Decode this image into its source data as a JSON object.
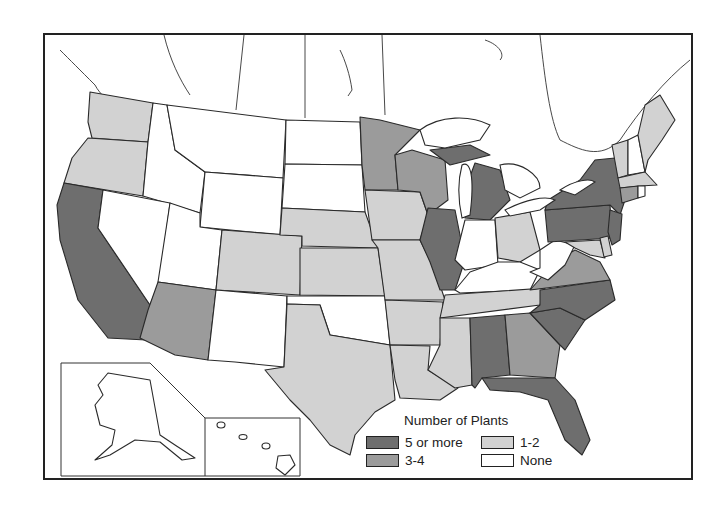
{
  "legend": {
    "title": "Number of Plants",
    "items": [
      {
        "key": "c5",
        "label": "5 or more",
        "color": "#6e6e6e"
      },
      {
        "key": "c1",
        "label": "1-2",
        "color": "#d2d2d2"
      },
      {
        "key": "c3",
        "label": "3-4",
        "color": "#9b9b9b"
      },
      {
        "key": "c0",
        "label": "None",
        "color": "#ffffff"
      }
    ]
  },
  "categories": {
    "5 or more": [
      "California",
      "Illinois",
      "Michigan",
      "New York",
      "Pennsylvania",
      "New Jersey",
      "North Carolina",
      "South Carolina",
      "Alabama",
      "Florida"
    ],
    "3-4": [
      "Arizona",
      "Minnesota",
      "Wisconsin",
      "Virginia",
      "Georgia",
      "Connecticut"
    ],
    "1-2": [
      "Washington",
      "Oregon",
      "Colorado",
      "Nebraska",
      "Kansas",
      "Texas",
      "Iowa",
      "Missouri",
      "Arkansas",
      "Louisiana",
      "Mississippi",
      "Tennessee",
      "Ohio",
      "Maryland",
      "Delaware",
      "Massachusetts",
      "Vermont",
      "Maine"
    ],
    "None": [
      "Idaho",
      "Montana",
      "Wyoming",
      "Nevada",
      "Utah",
      "New Mexico",
      "North Dakota",
      "South Dakota",
      "Oklahoma",
      "Indiana",
      "Kentucky",
      "West Virginia",
      "New Hampshire",
      "Rhode Island",
      "Alaska",
      "Hawaii"
    ]
  },
  "insets": [
    "Alaska",
    "Hawaii"
  ]
}
